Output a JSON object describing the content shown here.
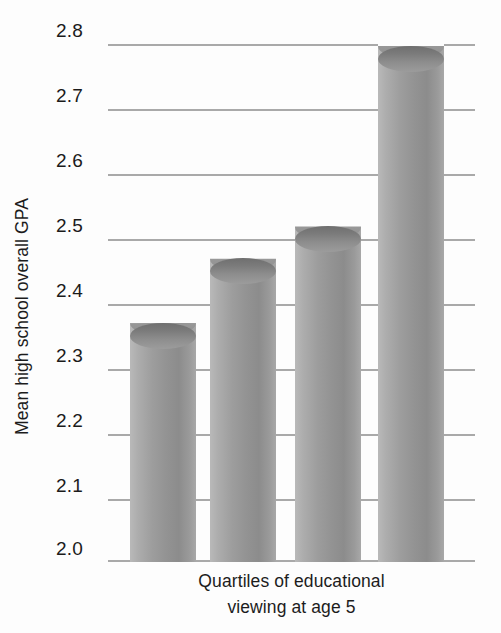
{
  "chart_data": {
    "type": "bar",
    "title": "",
    "subtitle": "",
    "xlabel": "Quartiles of educational viewing at age 5",
    "xlabel_line1": "Quartiles of educational",
    "xlabel_line2": "viewing at age 5",
    "ylabel": "Mean high school overall GPA",
    "categories": [
      "1",
      "2",
      "3",
      "4"
    ],
    "values": [
      2.37,
      2.47,
      2.52,
      2.8
    ],
    "ylim": [
      2.0,
      2.8
    ],
    "ytick_labels": [
      "2.8",
      "2.7",
      "2.6",
      "2.5",
      "2.4",
      "2.3",
      "2.2",
      "2.1",
      "2.0"
    ],
    "ytick_values": [
      2.8,
      2.7,
      2.6,
      2.5,
      2.4,
      2.3,
      2.2,
      2.1,
      2.0
    ],
    "xtick_labels": [],
    "grid": true,
    "grid_orientation": "horizontal",
    "legend": null,
    "legend_position": "none",
    "bar_style": "cylinder",
    "colors": {
      "bar_light": "#b9b9b9",
      "bar_mid": "#939393",
      "bar_dark": "#6f6f6f",
      "gridline": "#a9a9a9",
      "text": "#1c1c1c",
      "background": "#fdfdfd"
    }
  }
}
